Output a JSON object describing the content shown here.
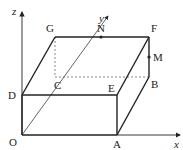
{
  "diagram": {
    "type": "3d-coordinate-box",
    "axes": {
      "x": "x",
      "y": "y",
      "z": "z"
    },
    "points": {
      "O": "O",
      "A": "A",
      "B": "B",
      "C": "C",
      "D": "D",
      "E": "E",
      "F": "F",
      "G": "G",
      "M": "M",
      "N": "N"
    },
    "colors": {
      "line": "#222222",
      "background": "#ffffff"
    }
  }
}
